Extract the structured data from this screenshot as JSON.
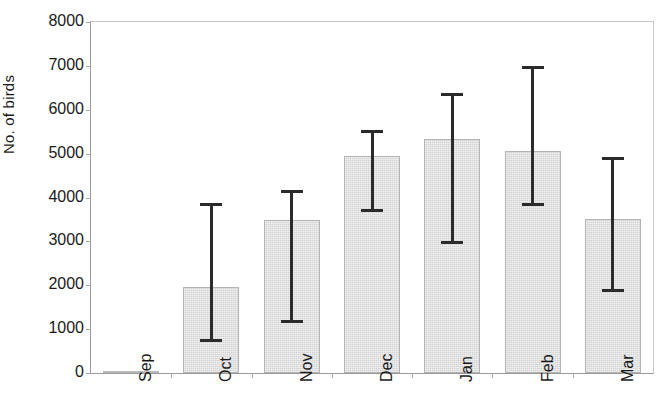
{
  "chart_data": {
    "type": "bar",
    "title": "",
    "subtitle": "",
    "xlabel": "",
    "ylabel": "No. of birds",
    "categories": [
      "Sep",
      "Oct",
      "Nov",
      "Dec",
      "Jan",
      "Feb",
      "Mar"
    ],
    "values": [
      50,
      1950,
      3480,
      4950,
      5330,
      5050,
      3520
    ],
    "error_upper": [
      50,
      3830,
      4130,
      5500,
      6350,
      6970,
      4900
    ],
    "error_lower": [
      50,
      740,
      1170,
      3700,
      2970,
      3840,
      1890
    ],
    "ylim": [
      0,
      8000
    ],
    "ytick_labels": [
      "0",
      "1000",
      "2000",
      "3000",
      "4000",
      "5000",
      "6000",
      "7000",
      "8000"
    ],
    "ytick_values": [
      0,
      1000,
      2000,
      3000,
      4000,
      5000,
      6000,
      7000,
      8000
    ],
    "grid": false,
    "legend": false,
    "legend_position": "none",
    "bar_color": "#d4d4d4",
    "bar_edge_color": "#b4b4b4",
    "error_color": "#2b2b2b",
    "axis_color": "#9a9a9a",
    "series": [
      {
        "name": "No. of birds",
        "values": [
          50,
          1950,
          3480,
          4950,
          5330,
          5050,
          3520
        ]
      }
    ]
  }
}
